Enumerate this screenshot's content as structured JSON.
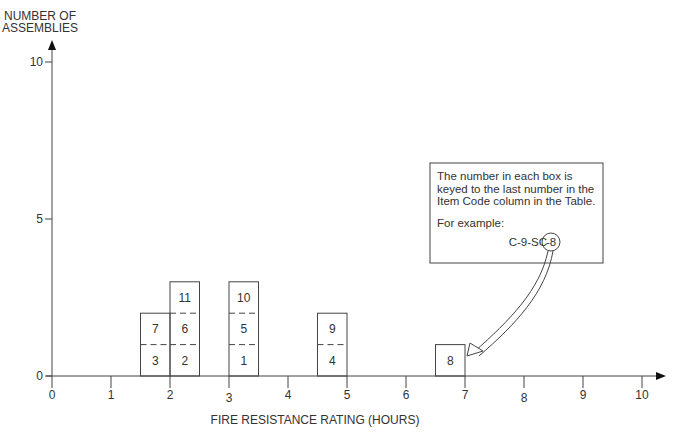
{
  "chart_data": {
    "type": "bar",
    "subtype": "stacked-histogram",
    "title": "",
    "ylabel": "NUMBER OF ASSEMBLIES",
    "xlabel": "FIRE RESISTANCE RATING (HOURS)",
    "xlim": [
      0,
      10
    ],
    "ylim": [
      0,
      10
    ],
    "x_ticks": [
      "0",
      "1",
      "2",
      "3",
      "4",
      "5",
      "6",
      "7",
      "8",
      "9",
      "10"
    ],
    "y_ticks": [
      "0",
      "5",
      "10"
    ],
    "grid": false,
    "bars": [
      {
        "x_start": 1.5,
        "x_end": 2.0,
        "count": 2,
        "items": [
          "3",
          "7"
        ]
      },
      {
        "x_start": 2.0,
        "x_end": 2.5,
        "count": 3,
        "items": [
          "2",
          "6",
          "11"
        ]
      },
      {
        "x_start": 3.0,
        "x_end": 3.5,
        "count": 3,
        "items": [
          "1",
          "5",
          "10"
        ]
      },
      {
        "x_start": 4.5,
        "x_end": 5.0,
        "count": 2,
        "items": [
          "4",
          "9"
        ]
      },
      {
        "x_start": 6.5,
        "x_end": 7.0,
        "count": 1,
        "items": [
          "8"
        ]
      }
    ],
    "annotation": {
      "lines": [
        "The number in each box is",
        "keyed to the last number in the",
        "Item Code column in the Table."
      ],
      "example_label": "For example:",
      "example_prefix": "C-9-SC",
      "example_suffix": "-8",
      "points_to_item": "8"
    }
  },
  "labels": {
    "ylabel_line1": "NUMBER OF",
    "ylabel_line2": "ASSEMBLIES",
    "xlabel": "FIRE RESISTANCE RATING (HOURS)"
  }
}
